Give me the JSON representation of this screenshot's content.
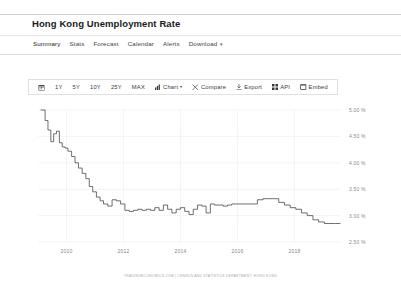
{
  "header": {
    "title": "Hong Kong Unemployment Rate"
  },
  "nav": {
    "items": [
      {
        "label": "Summary",
        "active": true
      },
      {
        "label": "Stats",
        "active": false
      },
      {
        "label": "Forecast",
        "active": false
      },
      {
        "label": "Calendar",
        "active": false
      },
      {
        "label": "Alerts",
        "active": false
      },
      {
        "label": "Download",
        "active": false
      }
    ],
    "download_caret": "▾"
  },
  "toolbar": {
    "calendar_icon": "calendar-icon",
    "ranges": [
      "1Y",
      "5Y",
      "10Y",
      "25Y",
      "MAX"
    ],
    "chart_label": "Chart",
    "chart_caret": "▾",
    "compare_label": "Compare",
    "export_label": "Export",
    "api_label": "API",
    "embed_label": "Embed"
  },
  "footer": {
    "attribution": "TRADINGECONOMICS.COM | CENSUS AND STATISTICS DEPARTMENT, HONG KONG"
  },
  "chart_data": {
    "type": "line",
    "title": "Hong Kong Unemployment Rate",
    "xlabel": "",
    "ylabel": "",
    "unit": "%",
    "grid": true,
    "legend": "none",
    "xlim": [
      2009.0,
      2019.6
    ],
    "ylim": [
      2.5,
      5.0
    ],
    "ytick_labels": [
      "5.00 %",
      "4.50 %",
      "4.00 %",
      "3.50 %",
      "3.00 %",
      "2.50 %"
    ],
    "yticks": [
      5.0,
      4.5,
      4.0,
      3.5,
      3.0,
      2.5
    ],
    "xtick_labels": [
      "2010",
      "2012",
      "2014",
      "2016",
      "2018"
    ],
    "xticks": [
      2010,
      2012,
      2014,
      2016,
      2018
    ],
    "series": [
      {
        "name": "Unemployment Rate",
        "color": "#4a4a4a",
        "x": [
          2009.1,
          2009.25,
          2009.35,
          2009.45,
          2009.55,
          2009.65,
          2009.75,
          2009.85,
          2009.95,
          2010.05,
          2010.18,
          2010.3,
          2010.42,
          2010.55,
          2010.68,
          2010.8,
          2010.92,
          2011.05,
          2011.18,
          2011.3,
          2011.45,
          2011.6,
          2011.75,
          2011.9,
          2012.05,
          2012.2,
          2012.35,
          2012.5,
          2012.65,
          2012.8,
          2012.95,
          2013.1,
          2013.25,
          2013.4,
          2013.55,
          2013.7,
          2013.85,
          2014.0,
          2014.15,
          2014.3,
          2014.45,
          2014.6,
          2014.75,
          2014.9,
          2015.05,
          2015.2,
          2015.35,
          2015.5,
          2015.65,
          2015.8,
          2015.95,
          2016.1,
          2016.3,
          2016.5,
          2016.7,
          2016.9,
          2017.05,
          2017.25,
          2017.45,
          2017.65,
          2017.85,
          2018.05,
          2018.25,
          2018.45,
          2018.65,
          2018.85,
          2019.05,
          2019.25,
          2019.45
        ],
        "y": [
          5.0,
          4.8,
          4.62,
          4.4,
          4.55,
          4.6,
          4.38,
          4.3,
          4.28,
          4.22,
          4.12,
          4.0,
          3.9,
          3.8,
          3.7,
          3.55,
          3.45,
          3.35,
          3.28,
          3.22,
          3.18,
          3.3,
          3.28,
          3.22,
          3.1,
          3.08,
          3.1,
          3.12,
          3.1,
          3.12,
          3.1,
          3.15,
          3.1,
          3.2,
          3.12,
          3.05,
          3.12,
          3.15,
          3.08,
          3.02,
          3.12,
          3.2,
          3.18,
          3.05,
          3.22,
          3.2,
          3.2,
          3.18,
          3.2,
          3.22,
          3.22,
          3.22,
          3.22,
          3.22,
          3.3,
          3.32,
          3.32,
          3.32,
          3.25,
          3.2,
          3.15,
          3.12,
          3.05,
          3.0,
          2.92,
          2.88,
          2.85,
          2.85,
          2.85
        ]
      }
    ]
  }
}
